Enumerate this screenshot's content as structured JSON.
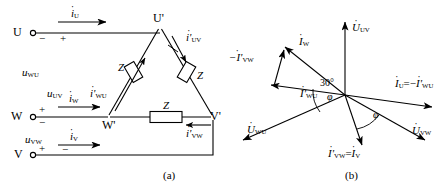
{
  "figure": {
    "title_a": "(a)",
    "title_b": "(b)",
    "background": "#ffffff",
    "stroke": "#000000"
  },
  "circuit": {
    "terminals": [
      {
        "name": "U",
        "label": "U",
        "x": 18,
        "y": 33,
        "polarity_minus": "−",
        "polarity_plus": "+"
      },
      {
        "name": "W",
        "label": "W",
        "x": 18,
        "y": 117,
        "polarity_plus": "+",
        "polarity_minus": "−"
      },
      {
        "name": "V",
        "label": "V",
        "x": 18,
        "y": 155,
        "polarity_plus": "+",
        "polarity_minus": "−"
      }
    ],
    "nodes": [
      {
        "name": "U-prime",
        "label": "U'",
        "x": 160,
        "y": 26
      },
      {
        "name": "W-prime",
        "label": "W'",
        "x": 108,
        "y": 117
      },
      {
        "name": "V-prime",
        "label": "V'",
        "x": 213,
        "y": 117
      }
    ],
    "impedances": [
      {
        "name": "Z-wu",
        "label": "Z"
      },
      {
        "name": "Z-uv",
        "label": "Z"
      },
      {
        "name": "Z-vw",
        "label": "Z"
      }
    ],
    "line_currents": [
      {
        "name": "i-u",
        "sym": "i",
        "sub": "U"
      },
      {
        "name": "i-w",
        "sym": "i",
        "sub": "W"
      },
      {
        "name": "i-v",
        "sym": "i",
        "sub": "V"
      }
    ],
    "phase_currents": [
      {
        "name": "i-uv-prime",
        "sym": "i'",
        "sub": "UV"
      },
      {
        "name": "i-wu-prime",
        "sym": "i'",
        "sub": "WU"
      },
      {
        "name": "i-vw-prime",
        "sym": "i'",
        "sub": "VW"
      }
    ],
    "voltages": [
      {
        "name": "u-wu",
        "sym": "u",
        "sub": "WU"
      },
      {
        "name": "u-uv",
        "sym": "u",
        "sub": "UV"
      },
      {
        "name": "u-vw",
        "sym": "u",
        "sub": "VW"
      }
    ]
  },
  "phasor": {
    "origin": {
      "x": 345,
      "y": 95
    },
    "angles": {
      "thirty": "30°",
      "phi": "φ"
    },
    "vectors": [
      {
        "name": "U-uv",
        "sym": "U",
        "sub": "UV",
        "dot": true
      },
      {
        "name": "U-wu",
        "sym": "U",
        "sub": "WU",
        "dot": true
      },
      {
        "name": "U-vw",
        "sym": "U",
        "sub": "VW",
        "dot": true
      },
      {
        "name": "I-w",
        "sym": "I",
        "sub": "W",
        "dot": true
      },
      {
        "name": "neg-I-vw-prime",
        "sym": "−I'",
        "sub": "VW",
        "dot": true
      },
      {
        "name": "I-wu-prime",
        "sym": "I'",
        "sub": "WU",
        "dot": true
      },
      {
        "name": "I-u-eq-neg-I-wu-prime",
        "lead_sym": "I",
        "lead_sub": "U",
        "eq": "=−",
        "tail_sym": "I'",
        "tail_sub": "WU",
        "dot": true
      },
      {
        "name": "I-vw-prime-eq-I-v",
        "lead_sym": "I'",
        "lead_sub": "VW",
        "eq": "=",
        "tail_sym": "I",
        "tail_sub": "V",
        "dot": true
      }
    ]
  }
}
